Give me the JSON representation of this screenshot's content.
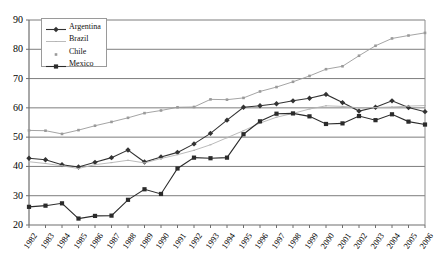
{
  "chart_data": {
    "type": "line",
    "title": "",
    "xlabel": "",
    "ylabel": "",
    "grid": true,
    "legend_position": "top-left",
    "xlim": [
      1982,
      2006
    ],
    "ylim": [
      20,
      90
    ],
    "ytick_labels": [
      "20",
      "30",
      "40",
      "50",
      "60",
      "70",
      "80",
      "90"
    ],
    "yticks": [
      20,
      30,
      40,
      50,
      60,
      70,
      80,
      90
    ],
    "categories": [
      1982,
      1983,
      1984,
      1985,
      1986,
      1987,
      1988,
      1989,
      1990,
      1991,
      1992,
      1993,
      1994,
      1995,
      1996,
      1997,
      1998,
      1999,
      2000,
      2001,
      2002,
      2003,
      2004,
      2005,
      2006
    ],
    "xtick_labels": [
      "1982",
      "1983",
      "1984",
      "1985",
      "1986",
      "1987",
      "1988",
      "1989",
      "1990",
      "1991",
      "1992",
      "1993",
      "1994",
      "1995",
      "1996",
      "1997",
      "1998",
      "1999",
      "2000",
      "2001",
      "2002",
      "2003",
      "2004",
      "2005",
      "2006"
    ],
    "series": [
      {
        "name": "Argentina",
        "color": "#333333",
        "marker": "diamond",
        "values": [
          42.8,
          42.3,
          40.6,
          39.8,
          41.4,
          43.0,
          45.6,
          41.5,
          43.2,
          44.8,
          47.7,
          51.3,
          55.8,
          60.2,
          60.7,
          61.4,
          62.4,
          63.3,
          64.6,
          61.8,
          58.9,
          60.2,
          62.4,
          60.1,
          58.7
        ]
      },
      {
        "name": "Brazil",
        "color": "#b3b3b3",
        "marker": "line",
        "values": [
          41.6,
          41.0,
          40.2,
          39.3,
          40.6,
          41.3,
          42.1,
          41.2,
          42.7,
          44.0,
          45.5,
          47.4,
          49.8,
          52.2,
          54.8,
          56.8,
          58.1,
          59.6,
          60.7,
          60.5,
          60.0,
          60.1,
          60.3,
          60.6,
          60.8
        ]
      },
      {
        "name": "Chile",
        "color": "#9a9a9a",
        "marker": "dot",
        "values": [
          52.3,
          52.2,
          51.1,
          52.4,
          53.9,
          55.2,
          56.6,
          58.2,
          59.1,
          60.2,
          60.3,
          62.9,
          62.8,
          63.4,
          65.6,
          67.1,
          68.9,
          70.9,
          73.2,
          74.2,
          77.8,
          81.2,
          83.7,
          84.7,
          85.6
        ]
      },
      {
        "name": "Mexico",
        "color": "#2b2b2b",
        "marker": "square",
        "values": [
          26.2,
          26.6,
          27.4,
          22.2,
          23.1,
          23.2,
          28.6,
          32.2,
          30.6,
          39.3,
          43.0,
          42.8,
          43.0,
          51.0,
          55.4,
          58.0,
          58.1,
          57.1,
          54.5,
          54.7,
          57.2,
          55.8,
          57.8,
          55.3,
          54.3
        ]
      }
    ]
  }
}
